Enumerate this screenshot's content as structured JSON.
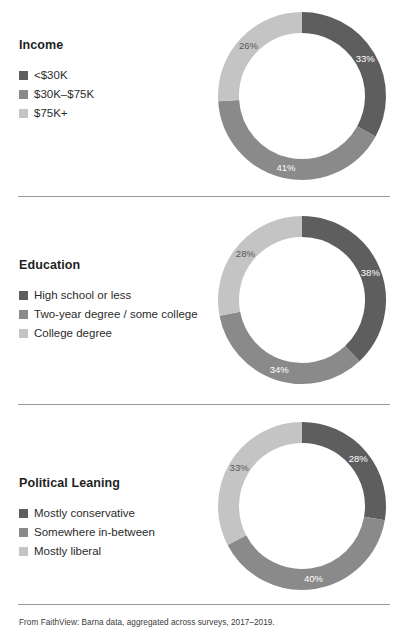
{
  "footnote": "From FaithView: Barna data, aggregated across surveys, 2017–2019.",
  "colors": {
    "dark": "#5e5e5e",
    "mid": "#8a8a8a",
    "light": "#c4c4c4",
    "label_on_dark": "#ffffff",
    "label_on_mid": "#ffffff",
    "label_on_light": "#585858",
    "divider": "#9a9a9a",
    "text": "#2b2b2b"
  },
  "sections": [
    {
      "id": "income",
      "title": "Income",
      "legend": [
        {
          "label": "<$30K",
          "color": "#5e5e5e"
        },
        {
          "label": "$30K–$75K",
          "color": "#8a8a8a"
        },
        {
          "label": "$75K+",
          "color": "#c4c4c4"
        }
      ]
    },
    {
      "id": "education",
      "title": "Education",
      "legend": [
        {
          "label": "High school or less",
          "color": "#5e5e5e"
        },
        {
          "label": "Two-year degree / some college",
          "color": "#8a8a8a"
        },
        {
          "label": "College degree",
          "color": "#c4c4c4"
        }
      ]
    },
    {
      "id": "political",
      "title": "Political Leaning",
      "legend": [
        {
          "label": "Mostly conservative",
          "color": "#5e5e5e"
        },
        {
          "label": "Somewhere in-between",
          "color": "#8a8a8a"
        },
        {
          "label": "Mostly liberal",
          "color": "#c4c4c4"
        }
      ]
    }
  ],
  "chart_data": [
    {
      "type": "pie",
      "variant": "donut",
      "title": "Income",
      "categories": [
        "<$30K",
        "$30K–$75K",
        "$75K+"
      ],
      "values": [
        33,
        41,
        26
      ],
      "value_labels": [
        "33%",
        "41%",
        "26%"
      ],
      "colors": [
        "#5e5e5e",
        "#8a8a8a",
        "#c4c4c4"
      ],
      "label_colors": [
        "#ffffff",
        "#ffffff",
        "#585858"
      ],
      "units": "percent",
      "start_angle_deg": 0,
      "direction": "clockwise",
      "legend_position": "left"
    },
    {
      "type": "pie",
      "variant": "donut",
      "title": "Education",
      "categories": [
        "High school or less",
        "Two-year degree / some college",
        "College degree"
      ],
      "values": [
        38,
        34,
        28
      ],
      "value_labels": [
        "38%",
        "34%",
        "28%"
      ],
      "colors": [
        "#5e5e5e",
        "#8a8a8a",
        "#c4c4c4"
      ],
      "label_colors": [
        "#ffffff",
        "#ffffff",
        "#585858"
      ],
      "units": "percent",
      "start_angle_deg": 0,
      "direction": "clockwise",
      "legend_position": "left"
    },
    {
      "type": "pie",
      "variant": "donut",
      "title": "Political Leaning",
      "categories": [
        "Mostly conservative",
        "Somewhere in-between",
        "Mostly liberal"
      ],
      "values": [
        28,
        40,
        33
      ],
      "value_labels": [
        "28%",
        "40%",
        "33%"
      ],
      "colors": [
        "#5e5e5e",
        "#8a8a8a",
        "#c4c4c4"
      ],
      "label_colors": [
        "#ffffff",
        "#ffffff",
        "#585858"
      ],
      "units": "percent",
      "start_angle_deg": 0,
      "direction": "clockwise",
      "legend_position": "left"
    }
  ]
}
